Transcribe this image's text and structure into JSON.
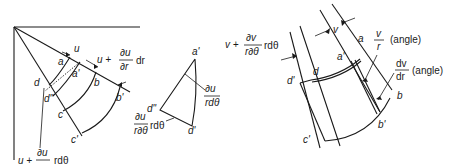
{
  "figure": {
    "panel_left": {
      "points": [
        "a",
        "a'",
        "b",
        "b'",
        "c",
        "c'",
        "d",
        "d'",
        "d\""
      ],
      "labels": {
        "u": "u",
        "u_plus": "u +",
        "du": "∂u",
        "dr": "∂r",
        "dr_tail": "dr",
        "bottom_u_plus": "u +",
        "bottom_du": "∂u",
        "bottom_rdtheta": "r∂θ",
        "bottom_tail": "rdθ"
      }
    },
    "panel_middle": {
      "points": [
        "a'",
        "d\"",
        "d'"
      ],
      "labels": {
        "du": "∂u",
        "rdtheta": "rdθ",
        "left_du": "∂u",
        "left_rdtheta": "r∂θ",
        "left_tail": "rdθ"
      }
    },
    "panel_right": {
      "points": [
        "a",
        "a'",
        "b",
        "b'",
        "c'",
        "d",
        "d'"
      ],
      "labels": {
        "v": "v",
        "v_plus": "v +",
        "dv": "∂v",
        "rdtheta": "r∂θ",
        "rdtheta_tail": "rdθ",
        "v_over": "v",
        "r_under": "r",
        "angle1": "(angle)",
        "dv2": "dv",
        "dr2": "dr",
        "angle2": "(angle)"
      }
    }
  }
}
